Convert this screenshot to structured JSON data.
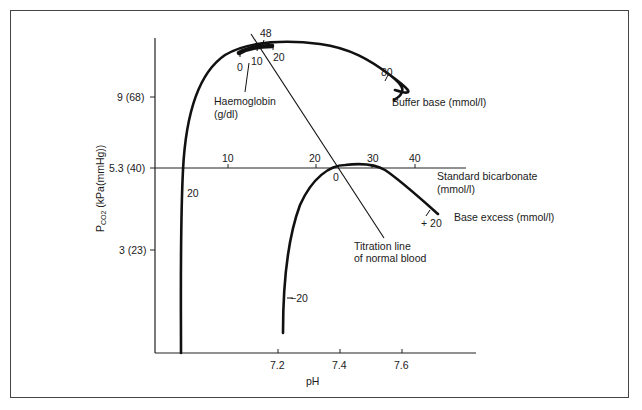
{
  "diagram": {
    "y_axis": {
      "label_prefix": "P",
      "label_subscript": "CO2",
      "label_suffix": " (kPa(mmHg))",
      "ticks": [
        {
          "label": "9 (68)",
          "value_kpa": 9
        },
        {
          "label": "5.3 (40)",
          "value_kpa": 5.3
        },
        {
          "label": "3 (23)",
          "value_kpa": 3
        }
      ]
    },
    "x_axis": {
      "label": "pH",
      "ticks": [
        {
          "label": "7.2",
          "value": 7.2
        },
        {
          "label": "7.4",
          "value": 7.4
        },
        {
          "label": "7.6",
          "value": 7.6
        }
      ]
    },
    "standard_bicarbonate": {
      "label_line1": "Standard bicarbonate",
      "label_line2": "(mmol/l)",
      "ticks": [
        "10",
        "20",
        "30",
        "40"
      ]
    },
    "buffer_base": {
      "label": "Buffer base (mmol/l)",
      "marks": [
        "20",
        "48",
        "80"
      ]
    },
    "haemoglobin": {
      "label_line1": "Haemoglobin",
      "label_line2": "(g/dl)",
      "marks": [
        "0",
        "10",
        "20"
      ]
    },
    "base_excess": {
      "label": "Base excess (mmol/l)",
      "marks": [
        "−20",
        "0",
        "+ 20"
      ]
    },
    "titration_line": {
      "label_line1": "Titration line",
      "label_line2": "of normal blood"
    }
  }
}
